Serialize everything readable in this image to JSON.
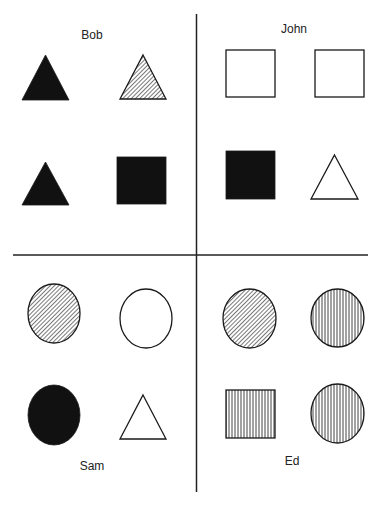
{
  "colors": {
    "ink": "#111111",
    "line": "#222222",
    "paper": "#ffffff"
  },
  "dividers": {
    "vertical": {
      "x": 196.5,
      "y1": 14,
      "y2": 492
    },
    "horizontal": {
      "y": 255,
      "x1": 13,
      "x2": 368
    }
  },
  "quadrants": [
    {
      "id": "bob",
      "label": "Bob",
      "label_pos": {
        "x": 92,
        "y": 28
      },
      "shapes": [
        {
          "type": "triangle",
          "fill": "solid",
          "x": 22,
          "y": 55,
          "w": 47,
          "h": 45
        },
        {
          "type": "triangle",
          "fill": "diagonal-hatch",
          "x": 120,
          "y": 55,
          "w": 46,
          "h": 44
        },
        {
          "type": "triangle",
          "fill": "solid",
          "x": 22,
          "y": 162,
          "w": 47,
          "h": 43
        },
        {
          "type": "square",
          "fill": "solid",
          "x": 117,
          "y": 157,
          "w": 49,
          "h": 47
        }
      ]
    },
    {
      "id": "john",
      "label": "John",
      "label_pos": {
        "x": 294,
        "y": 22
      },
      "shapes": [
        {
          "type": "square",
          "fill": "empty",
          "x": 226,
          "y": 50,
          "w": 49,
          "h": 47
        },
        {
          "type": "square",
          "fill": "empty",
          "x": 315,
          "y": 50,
          "w": 49,
          "h": 47
        },
        {
          "type": "square",
          "fill": "solid",
          "x": 226,
          "y": 151,
          "w": 49,
          "h": 48
        },
        {
          "type": "triangle",
          "fill": "empty",
          "x": 311,
          "y": 155,
          "w": 47,
          "h": 44
        }
      ]
    },
    {
      "id": "sam",
      "label": "Sam",
      "label_pos": {
        "x": 92,
        "y": 459
      },
      "shapes": [
        {
          "type": "circle",
          "fill": "diagonal-hatch",
          "x": 28,
          "y": 284,
          "w": 52,
          "h": 59
        },
        {
          "type": "circle",
          "fill": "empty",
          "x": 120,
          "y": 289,
          "w": 52,
          "h": 59
        },
        {
          "type": "circle",
          "fill": "solid",
          "x": 28,
          "y": 385,
          "w": 52,
          "h": 60
        },
        {
          "type": "triangle",
          "fill": "empty",
          "x": 120,
          "y": 395,
          "w": 46,
          "h": 44
        }
      ]
    },
    {
      "id": "ed",
      "label": "Ed",
      "label_pos": {
        "x": 292,
        "y": 454
      },
      "shapes": [
        {
          "type": "circle",
          "fill": "diagonal-hatch",
          "x": 223,
          "y": 289,
          "w": 53,
          "h": 59
        },
        {
          "type": "circle",
          "fill": "vertical-stripes",
          "x": 311,
          "y": 289,
          "w": 53,
          "h": 58
        },
        {
          "type": "square",
          "fill": "vertical-stripes",
          "x": 226,
          "y": 390,
          "w": 49,
          "h": 48
        },
        {
          "type": "circle",
          "fill": "vertical-stripes",
          "x": 311,
          "y": 384,
          "w": 53,
          "h": 59
        }
      ]
    }
  ]
}
